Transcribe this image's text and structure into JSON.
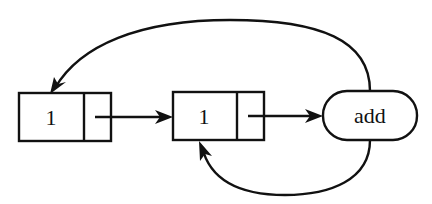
{
  "diagram": {
    "type": "linked-list-cycle",
    "nodes": [
      {
        "id": "cell-1",
        "kind": "cons-cell",
        "value": "1"
      },
      {
        "id": "cell-2",
        "kind": "cons-cell",
        "value": "1"
      },
      {
        "id": "proc-add",
        "kind": "procedure",
        "label": "add"
      }
    ],
    "edges": [
      {
        "from": "cell-1.next",
        "to": "cell-2",
        "shape": "straight"
      },
      {
        "from": "cell-2.next",
        "to": "proc-add",
        "shape": "straight"
      },
      {
        "from": "proc-add",
        "to": "cell-1",
        "shape": "arc-over"
      },
      {
        "from": "proc-add",
        "to": "cell-2",
        "shape": "arc-under"
      }
    ],
    "colors": {
      "line": "#111111",
      "background": "#ffffff"
    }
  }
}
